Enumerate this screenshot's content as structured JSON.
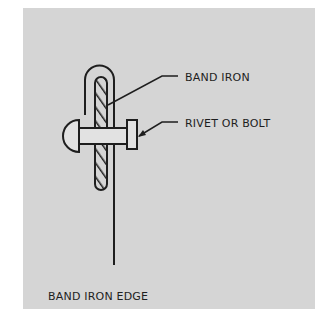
{
  "diagram": {
    "labels": {
      "band_iron": "BAND IRON",
      "rivet_or_bolt": "RIVET OR BOLT",
      "band_iron_edge": "BAND IRON EDGE"
    },
    "colors": {
      "background": "#ffffff",
      "panel": "#d5d5d5",
      "ink": "#1e1e1e",
      "rivet_fill": "#e2e2e2"
    }
  }
}
